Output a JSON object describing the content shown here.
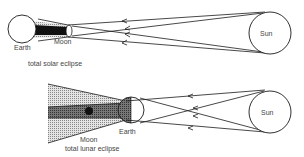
{
  "top_diagram": {
    "caption": "total solar eclipse",
    "earth_label": "Earth",
    "moon_label": "Moon",
    "sun_label": "Sun"
  },
  "bottom_diagram": {
    "caption": "total lunar eclipse",
    "earth_label": "Earth",
    "moon_label": "Moon",
    "sun_label": "Sun"
  },
  "colors": {
    "line": "#1a1a1a",
    "penumbra": "#c8c8c8",
    "umbra": "#6a6a6a",
    "text": "#444444"
  }
}
